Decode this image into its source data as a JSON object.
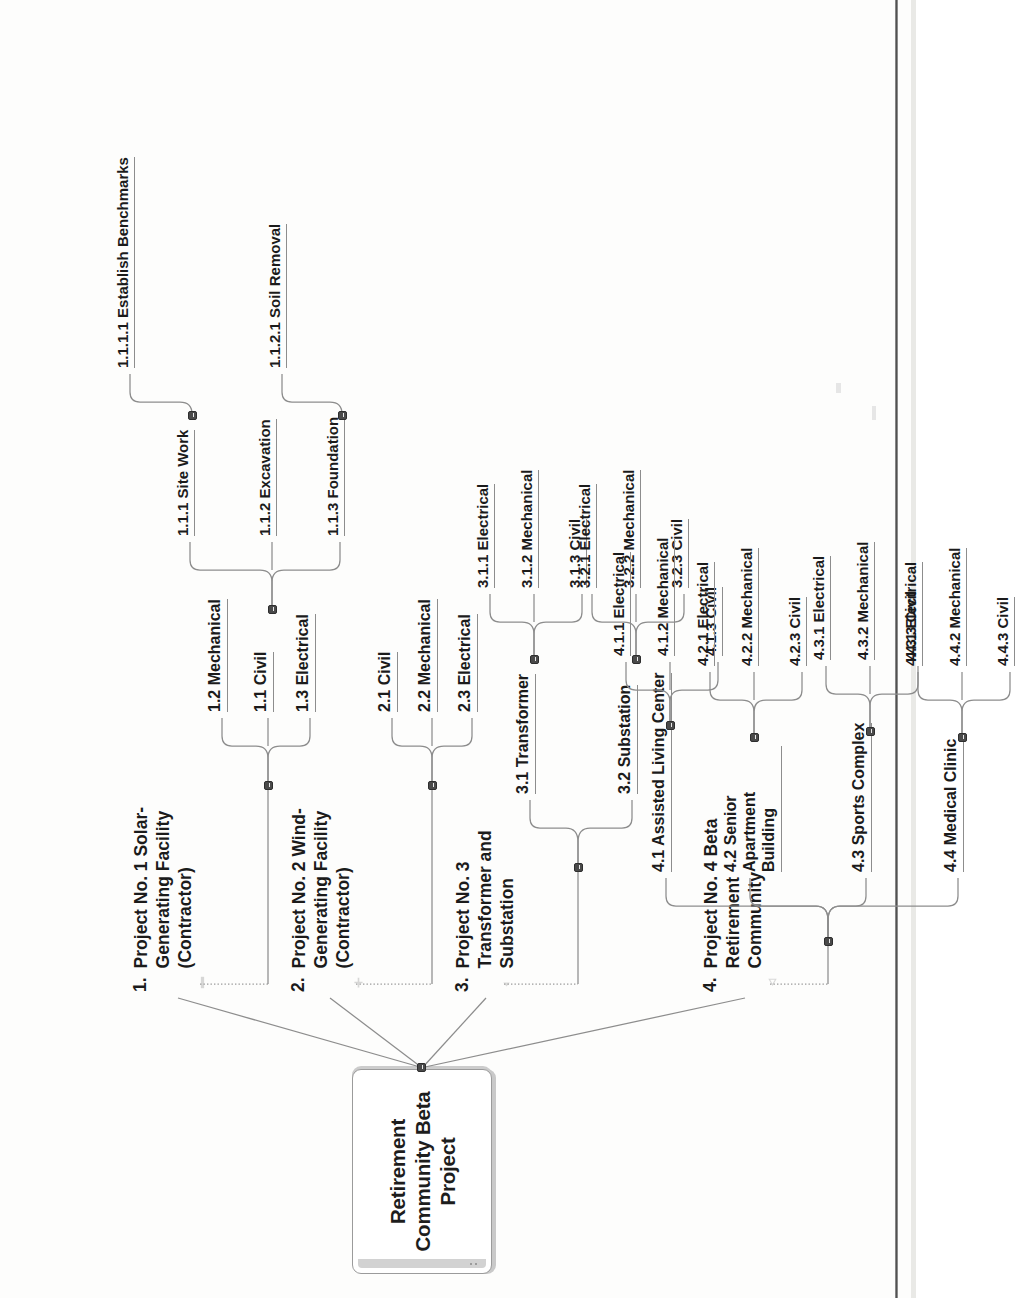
{
  "document": {
    "type": "work-breakdown-structure-mindmap",
    "orientation": "rotated-90-landscape-scan"
  },
  "root": {
    "label": "Retirement Community Beta Project"
  },
  "branches": [
    {
      "number": "1.",
      "title": "Project No. 1 Solar-Generating Facility (Contractor)",
      "children": [
        {
          "label": "1.1  Civil",
          "children": [
            {
              "label": "1.1.1  Site Work",
              "children": [
                {
                  "label": "1.1.1.1  Establish Benchmarks"
                }
              ]
            },
            {
              "label": "1.1.2  Excavation",
              "children": [
                {
                  "label": "1.1.2.1  Soil Removal"
                }
              ]
            },
            {
              "label": "1.1.3  Foundation"
            }
          ]
        },
        {
          "label": "1.2  Mechanical"
        },
        {
          "label": "1.3  Electrical"
        }
      ]
    },
    {
      "number": "2.",
      "title": "Project No. 2 Wind-Generating Facility (Contractor)",
      "children": [
        {
          "label": "2.1  Civil"
        },
        {
          "label": "2.2  Mechanical"
        },
        {
          "label": "2.3  Electrical"
        }
      ]
    },
    {
      "number": "3.",
      "title": "Project No. 3 Transformer and Substation",
      "children": [
        {
          "label": "3.1  Transformer",
          "children": [
            {
              "label": "3.1.1  Electrical"
            },
            {
              "label": "3.1.2  Mechanical"
            },
            {
              "label": "3.1.3  Civil"
            }
          ]
        },
        {
          "label": "3.2  Substation",
          "children": [
            {
              "label": "3.2.1  Electrical"
            },
            {
              "label": "3.2.2  Mechanical"
            },
            {
              "label": "3.2.3  Civil"
            }
          ]
        }
      ]
    },
    {
      "number": "4.",
      "title": "Project No. 4 Beta Retirement Community",
      "children": [
        {
          "label": "4.1  Assisted Living Center",
          "children": [
            {
              "label": "4.1.1  Electrical"
            },
            {
              "label": "4.1.2  Mechanical"
            },
            {
              "label": "4.1.3  Civil"
            }
          ]
        },
        {
          "label": "4.2  Senior Apartment Building",
          "children": [
            {
              "label": "4.2.1  Electrical"
            },
            {
              "label": "4.2.2  Mechanical"
            },
            {
              "label": "4.2.3  Civil"
            }
          ]
        },
        {
          "label": "4.3  Sports Complex",
          "children": [
            {
              "label": "4.3.1  Electrical"
            },
            {
              "label": "4.3.2  Mechanical"
            },
            {
              "label": "4.3.3  Civil"
            }
          ]
        },
        {
          "label": "4.4  Medical Clinic",
          "children": [
            {
              "label": "4.4.1  Electrical"
            },
            {
              "label": "4.4.2  Mechanical"
            },
            {
              "label": "4.4.3  Civil"
            }
          ]
        }
      ]
    }
  ],
  "colors": {
    "ink": "#1b1b1b",
    "line": "#8d8d8d",
    "knob": "#4a4a4a",
    "paper": "#fdfdfc",
    "shadow": "#c9c9c9"
  }
}
